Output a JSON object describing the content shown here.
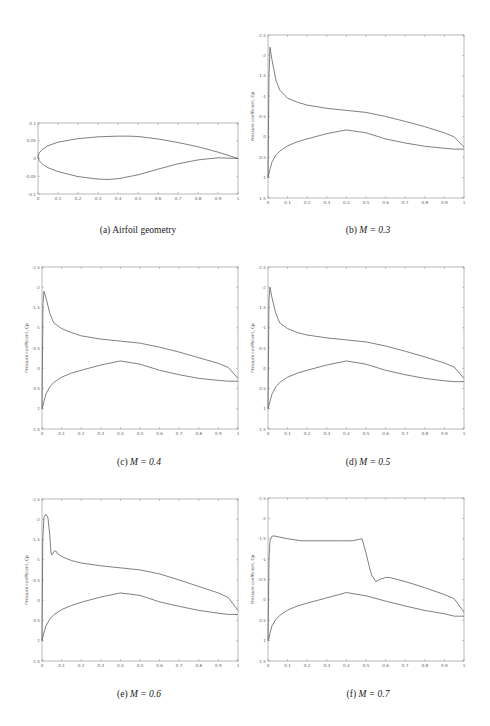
{
  "figure": {
    "panels": [
      {
        "id": "a",
        "caption_prefix": "(a)",
        "caption_text": "Airfoil geometry",
        "caption_math": ""
      },
      {
        "id": "b",
        "caption_prefix": "(b)",
        "caption_text": "",
        "caption_math": "M = 0.3"
      },
      {
        "id": "c",
        "caption_prefix": "(c)",
        "caption_text": "",
        "caption_math": "M = 0.4"
      },
      {
        "id": "d",
        "caption_prefix": "(d)",
        "caption_text": "",
        "caption_math": "M = 0.5"
      },
      {
        "id": "e",
        "caption_prefix": "(e)",
        "caption_text": "",
        "caption_math": "M = 0.6"
      },
      {
        "id": "f",
        "caption_prefix": "(f)",
        "caption_text": "",
        "caption_math": "M = 0.7"
      }
    ]
  },
  "chart_data": [
    {
      "id": "a",
      "type": "line",
      "title": "Airfoil geometry",
      "xlabel": "",
      "ylabel": "",
      "xlim": [
        0,
        1
      ],
      "ylim": [
        -0.1,
        0.1
      ],
      "xticks": [
        0,
        0.1,
        0.2,
        0.3,
        0.4,
        0.5,
        0.6,
        0.7,
        0.8,
        0.9,
        1
      ],
      "xtick_labels": [
        "0",
        "0.1",
        "0.2",
        "0.3",
        "0.4",
        "0.5",
        "0.6",
        "0.7",
        "0.8",
        "0.9",
        "1"
      ],
      "yticks": [
        -0.1,
        -0.05,
        0,
        0.05,
        0.1
      ],
      "ytick_labels": [
        "-0.1",
        "-0.05",
        "0",
        "0.05",
        "0.1"
      ],
      "grid": false,
      "series": [
        {
          "name": "upper surface",
          "x": [
            0,
            0.005,
            0.02,
            0.05,
            0.1,
            0.2,
            0.3,
            0.4,
            0.45,
            0.5,
            0.6,
            0.7,
            0.8,
            0.9,
            1
          ],
          "y": [
            0.005,
            0.015,
            0.025,
            0.036,
            0.046,
            0.056,
            0.061,
            0.063,
            0.063,
            0.062,
            0.055,
            0.045,
            0.033,
            0.018,
            0
          ]
        },
        {
          "name": "lower surface",
          "x": [
            0,
            0.005,
            0.02,
            0.05,
            0.1,
            0.2,
            0.3,
            0.35,
            0.4,
            0.5,
            0.6,
            0.7,
            0.8,
            0.9,
            1
          ],
          "y": [
            0.005,
            -0.005,
            -0.015,
            -0.026,
            -0.037,
            -0.051,
            -0.058,
            -0.059,
            -0.057,
            -0.046,
            -0.03,
            -0.015,
            -0.004,
            0.002,
            0
          ]
        }
      ]
    },
    {
      "id": "b",
      "type": "line",
      "title": "M = 0.3",
      "xlabel": "",
      "ylabel": "Pressure coefficient, Cp",
      "xlim": [
        0,
        1
      ],
      "ylim": [
        -2.5,
        1.5
      ],
      "y_reversed": true,
      "xticks": [
        0,
        0.1,
        0.2,
        0.3,
        0.4,
        0.5,
        0.6,
        0.7,
        0.8,
        0.9,
        1
      ],
      "xtick_labels": [
        "0",
        "0.1",
        "0.2",
        "0.3",
        "0.4",
        "0.5",
        "0.6",
        "0.7",
        "0.8",
        "0.9",
        "1"
      ],
      "yticks": [
        -2.5,
        -2,
        -1.5,
        -1,
        -0.5,
        0,
        0.5,
        1,
        1.5
      ],
      "ytick_labels": [
        "-2.5",
        "-2",
        "-1.5",
        "-1",
        "-0.5",
        "0",
        "0.5",
        "1",
        "1.5"
      ],
      "grid": false,
      "series": [
        {
          "name": "upper surface",
          "x": [
            0,
            0.005,
            0.01,
            0.02,
            0.04,
            0.06,
            0.1,
            0.15,
            0.2,
            0.3,
            0.4,
            0.5,
            0.6,
            0.7,
            0.8,
            0.9,
            0.95,
            1
          ],
          "y": [
            1.0,
            -1.5,
            -2.2,
            -1.9,
            -1.4,
            -1.15,
            -0.95,
            -0.85,
            -0.78,
            -0.7,
            -0.65,
            -0.6,
            -0.5,
            -0.38,
            -0.25,
            -0.1,
            0.0,
            0.25
          ]
        },
        {
          "name": "lower surface",
          "x": [
            0,
            0.005,
            0.01,
            0.02,
            0.04,
            0.06,
            0.1,
            0.15,
            0.2,
            0.3,
            0.4,
            0.5,
            0.6,
            0.7,
            0.8,
            0.9,
            0.95,
            1
          ],
          "y": [
            1.0,
            0.9,
            0.8,
            0.62,
            0.45,
            0.35,
            0.22,
            0.12,
            0.05,
            -0.08,
            -0.17,
            -0.1,
            0.05,
            0.15,
            0.23,
            0.28,
            0.3,
            0.3
          ]
        }
      ]
    },
    {
      "id": "c",
      "type": "line",
      "title": "M = 0.4",
      "xlabel": "",
      "ylabel": "Pressure coefficient, Cp",
      "xlim": [
        0,
        1
      ],
      "ylim": [
        -2.5,
        1.5
      ],
      "y_reversed": true,
      "xticks": [
        0,
        0.1,
        0.2,
        0.3,
        0.4,
        0.5,
        0.6,
        0.7,
        0.8,
        0.9,
        1
      ],
      "xtick_labels": [
        "0",
        "0.1",
        "0.2",
        "0.3",
        "0.4",
        "0.5",
        "0.6",
        "0.7",
        "0.8",
        "0.9",
        "1"
      ],
      "yticks": [
        -2.5,
        -2,
        -1.5,
        -1,
        -0.5,
        0,
        0.5,
        1,
        1.5
      ],
      "ytick_labels": [
        "-2.5",
        "-2",
        "-1.5",
        "-1",
        "-0.5",
        "0",
        "0.5",
        "1",
        "1.5"
      ],
      "grid": false,
      "series": [
        {
          "name": "upper surface",
          "x": [
            0,
            0.005,
            0.01,
            0.02,
            0.04,
            0.06,
            0.1,
            0.15,
            0.2,
            0.3,
            0.4,
            0.5,
            0.6,
            0.7,
            0.8,
            0.9,
            0.95,
            1
          ],
          "y": [
            1.0,
            -1.6,
            -1.9,
            -1.75,
            -1.35,
            -1.12,
            -0.98,
            -0.88,
            -0.8,
            -0.72,
            -0.67,
            -0.62,
            -0.52,
            -0.4,
            -0.26,
            -0.12,
            -0.02,
            0.25
          ]
        },
        {
          "name": "lower surface",
          "x": [
            0,
            0.005,
            0.01,
            0.02,
            0.04,
            0.06,
            0.1,
            0.15,
            0.2,
            0.3,
            0.4,
            0.5,
            0.6,
            0.7,
            0.8,
            0.9,
            0.95,
            1
          ],
          "y": [
            1.0,
            0.92,
            0.82,
            0.64,
            0.46,
            0.35,
            0.22,
            0.12,
            0.05,
            -0.08,
            -0.18,
            -0.1,
            0.05,
            0.16,
            0.25,
            0.3,
            0.32,
            0.32
          ]
        }
      ]
    },
    {
      "id": "d",
      "type": "line",
      "title": "M = 0.5",
      "xlabel": "",
      "ylabel": "Pressure coefficient, Cp",
      "xlim": [
        0,
        1
      ],
      "ylim": [
        -2.5,
        1.5
      ],
      "y_reversed": true,
      "xticks": [
        0,
        0.1,
        0.2,
        0.3,
        0.4,
        0.5,
        0.6,
        0.7,
        0.8,
        0.9,
        1
      ],
      "xtick_labels": [
        "0",
        "0.1",
        "0.2",
        "0.3",
        "0.4",
        "0.5",
        "0.6",
        "0.7",
        "0.8",
        "0.9",
        "1"
      ],
      "yticks": [
        -2.5,
        -2,
        -1.5,
        -1,
        -0.5,
        0,
        0.5,
        1,
        1.5
      ],
      "ytick_labels": [
        "-2.5",
        "-2",
        "-1.5",
        "-1",
        "-0.5",
        "0",
        "0.5",
        "1",
        "1.5"
      ],
      "grid": false,
      "series": [
        {
          "name": "upper surface",
          "x": [
            0,
            0.005,
            0.01,
            0.02,
            0.04,
            0.06,
            0.1,
            0.15,
            0.2,
            0.3,
            0.4,
            0.5,
            0.6,
            0.7,
            0.8,
            0.9,
            0.95,
            1
          ],
          "y": [
            1.0,
            -1.7,
            -2.0,
            -1.75,
            -1.35,
            -1.12,
            -0.98,
            -0.88,
            -0.82,
            -0.75,
            -0.7,
            -0.65,
            -0.55,
            -0.42,
            -0.28,
            -0.13,
            -0.03,
            0.25
          ]
        },
        {
          "name": "lower surface",
          "x": [
            0,
            0.005,
            0.01,
            0.02,
            0.04,
            0.06,
            0.1,
            0.15,
            0.2,
            0.3,
            0.4,
            0.5,
            0.6,
            0.7,
            0.8,
            0.9,
            0.95,
            1
          ],
          "y": [
            1.0,
            0.92,
            0.82,
            0.64,
            0.46,
            0.35,
            0.22,
            0.12,
            0.05,
            -0.08,
            -0.18,
            -0.1,
            0.05,
            0.16,
            0.25,
            0.31,
            0.33,
            0.33
          ]
        }
      ]
    },
    {
      "id": "e",
      "type": "line",
      "title": "M = 0.6",
      "xlabel": "",
      "ylabel": "Pressure coefficient, Cp",
      "xlim": [
        0,
        1
      ],
      "ylim": [
        -2.5,
        1.5
      ],
      "y_reversed": true,
      "xticks": [
        0,
        0.1,
        0.2,
        0.3,
        0.4,
        0.5,
        0.6,
        0.7,
        0.8,
        0.9,
        1
      ],
      "xtick_labels": [
        "0",
        "0.1",
        "0.2",
        "0.3",
        "0.4",
        "0.5",
        "0.6",
        "0.7",
        "0.8",
        "0.9",
        "1"
      ],
      "yticks": [
        -2.5,
        -2,
        -1.5,
        -1,
        -0.5,
        0,
        0.5,
        1,
        1.5
      ],
      "ytick_labels": [
        "-2.5",
        "-2",
        "-1.5",
        "-1",
        "-0.5",
        "0",
        "0.5",
        "1",
        "1.5"
      ],
      "grid": false,
      "series": [
        {
          "name": "upper surface",
          "x": [
            0,
            0.004,
            0.01,
            0.02,
            0.03,
            0.04,
            0.045,
            0.05,
            0.055,
            0.06,
            0.07,
            0.08,
            0.1,
            0.15,
            0.2,
            0.3,
            0.4,
            0.5,
            0.6,
            0.7,
            0.8,
            0.9,
            0.95,
            1
          ],
          "y": [
            1.0,
            -1.5,
            -2.05,
            -2.12,
            -2.05,
            -1.6,
            -1.2,
            -1.12,
            -1.15,
            -1.2,
            -1.22,
            -1.15,
            -1.08,
            -0.98,
            -0.92,
            -0.85,
            -0.8,
            -0.75,
            -0.65,
            -0.5,
            -0.34,
            -0.18,
            -0.07,
            0.25
          ]
        },
        {
          "name": "lower surface",
          "x": [
            0,
            0.005,
            0.01,
            0.02,
            0.04,
            0.06,
            0.1,
            0.15,
            0.2,
            0.3,
            0.4,
            0.5,
            0.6,
            0.7,
            0.8,
            0.9,
            0.95,
            1
          ],
          "y": [
            1.0,
            0.9,
            0.8,
            0.64,
            0.46,
            0.36,
            0.23,
            0.13,
            0.05,
            -0.08,
            -0.18,
            -0.12,
            0.04,
            0.15,
            0.25,
            0.32,
            0.35,
            0.35
          ]
        }
      ]
    },
    {
      "id": "f",
      "type": "line",
      "title": "M = 0.7",
      "xlabel": "",
      "ylabel": "Pressure coefficient, Cp",
      "xlim": [
        0,
        1
      ],
      "ylim": [
        -2.5,
        1.5
      ],
      "y_reversed": true,
      "xticks": [
        0,
        0.1,
        0.2,
        0.3,
        0.4,
        0.5,
        0.6,
        0.7,
        0.8,
        0.9,
        1
      ],
      "xtick_labels": [
        "0",
        "0.1",
        "0.2",
        "0.3",
        "0.4",
        "0.5",
        "0.6",
        "0.7",
        "0.8",
        "0.9",
        "1"
      ],
      "yticks": [
        -2.5,
        -2,
        -1.5,
        -1,
        -0.5,
        0,
        0.5,
        1,
        1.5
      ],
      "ytick_labels": [
        "-2.5",
        "-2",
        "-1.5",
        "-1",
        "-0.5",
        "0",
        "0.5",
        "1",
        "1.5"
      ],
      "grid": false,
      "series": [
        {
          "name": "upper surface",
          "x": [
            0,
            0.005,
            0.01,
            0.02,
            0.03,
            0.05,
            0.1,
            0.17,
            0.25,
            0.35,
            0.43,
            0.46,
            0.48,
            0.5,
            0.52,
            0.53,
            0.55,
            0.57,
            0.6,
            0.62,
            0.7,
            0.8,
            0.9,
            0.95,
            1
          ],
          "y": [
            1.0,
            -1.0,
            -1.45,
            -1.56,
            -1.57,
            -1.55,
            -1.5,
            -1.45,
            -1.45,
            -1.45,
            -1.45,
            -1.48,
            -1.5,
            -1.15,
            -0.75,
            -0.6,
            -0.45,
            -0.5,
            -0.55,
            -0.55,
            -0.45,
            -0.3,
            -0.13,
            -0.03,
            0.3
          ]
        },
        {
          "name": "lower surface",
          "x": [
            0,
            0.005,
            0.01,
            0.02,
            0.04,
            0.06,
            0.1,
            0.15,
            0.2,
            0.3,
            0.4,
            0.5,
            0.6,
            0.7,
            0.8,
            0.9,
            0.95,
            1
          ],
          "y": [
            1.0,
            0.95,
            0.82,
            0.64,
            0.48,
            0.38,
            0.25,
            0.15,
            0.08,
            -0.05,
            -0.18,
            -0.1,
            0.03,
            0.15,
            0.26,
            0.34,
            0.4,
            0.4
          ]
        }
      ]
    }
  ]
}
